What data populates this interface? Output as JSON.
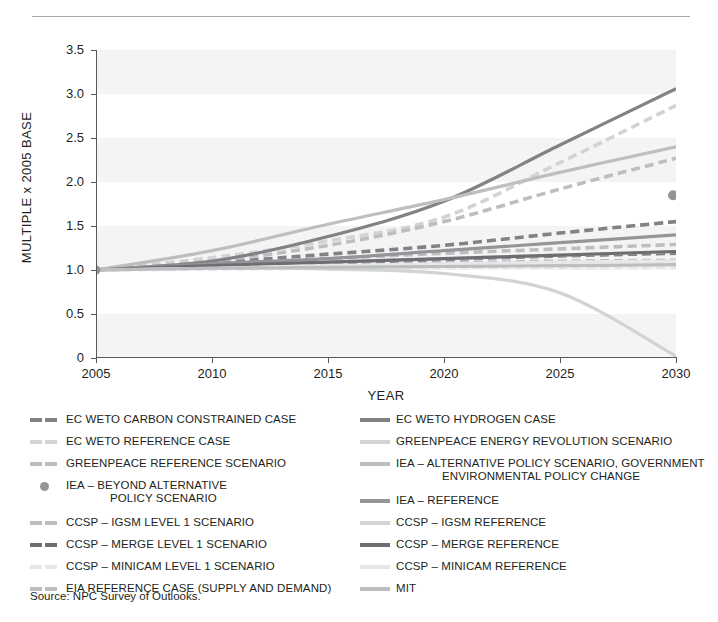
{
  "source_note": "Source: NPC Survey of Outlooks.",
  "chart_data": {
    "type": "line",
    "title": "",
    "xlabel": "YEAR",
    "ylabel": "MULTIPLE x 2005 BASE",
    "xlim": [
      2005,
      2030
    ],
    "ylim": [
      0,
      3.5
    ],
    "xticks": [
      "2005",
      "2010",
      "2015",
      "2020",
      "2025",
      "2030"
    ],
    "yticks": [
      "0",
      "0.5",
      "1.0",
      "1.5",
      "2.0",
      "2.5",
      "3.0",
      "3.5"
    ],
    "grid": "horizontal-bands",
    "legend_position": "below",
    "x": [
      2005,
      2010,
      2015,
      2020,
      2025,
      2030
    ],
    "series": [
      {
        "name": "EC WETO CARBON CONSTRAINED CASE",
        "style": "dashed",
        "color": "#808285",
        "values": [
          1.0,
          1.08,
          1.18,
          1.28,
          1.42,
          1.55
        ]
      },
      {
        "name": "EC WETO REFERENCE CASE",
        "style": "dashed",
        "color": "#d1d3d4",
        "values": [
          1.0,
          1.14,
          1.33,
          1.6,
          2.22,
          2.87
        ]
      },
      {
        "name": "GREENPEACE REFERENCE SCENARIO",
        "style": "dashed",
        "color": "#bcbec0",
        "values": [
          1.0,
          1.1,
          1.28,
          1.55,
          1.92,
          2.27
        ]
      },
      {
        "name": "IEA – BEYOND ALTERNATIVE POLICY SCENARIO",
        "style": "marker",
        "color": "#939598",
        "values": [
          null,
          null,
          null,
          null,
          null,
          1.85
        ]
      },
      {
        "name": "CCSP – IGSM LEVEL 1 SCENARIO",
        "style": "dashed",
        "color": "#bcbec0",
        "values": [
          1.0,
          1.03,
          1.06,
          1.08,
          1.1,
          1.11
        ]
      },
      {
        "name": "CCSP – MERGE LEVEL 1 SCENARIO",
        "style": "dashed",
        "color": "#808285",
        "values": [
          1.0,
          1.04,
          1.08,
          1.12,
          1.16,
          1.19
        ]
      },
      {
        "name": "CCSP – MINICAM LEVEL 1 SCENARIO",
        "style": "dashed",
        "color": "#e6e7e8",
        "values": [
          1.0,
          1.01,
          1.02,
          1.03,
          1.03,
          1.03
        ]
      },
      {
        "name": "EIA REFERENCE CASE (SUPPLY AND DEMAND)",
        "style": "dashed",
        "color": "#bcbec0",
        "values": [
          1.0,
          1.06,
          1.13,
          1.19,
          1.24,
          1.29
        ]
      },
      {
        "name": "EC WETO HYDROGEN CASE",
        "style": "solid",
        "color": "#808285",
        "values": [
          1.0,
          1.1,
          1.38,
          1.78,
          2.42,
          3.06
        ]
      },
      {
        "name": "GREENPEACE ENERGY REVOLUTION SCENARIO",
        "style": "solid",
        "color": "#d1d3d4",
        "values": [
          1.0,
          1.02,
          1.01,
          0.96,
          0.74,
          0.02
        ]
      },
      {
        "name": "IEA – ALTERNATIVE POLICY SCENARIO, GOVERNMENT ENVIRONMENTAL POLICY CHANGE",
        "style": "solid",
        "color": "#bcbec0",
        "values": [
          1.0,
          1.22,
          1.52,
          1.8,
          2.11,
          2.4
        ]
      },
      {
        "name": "IEA – REFERENCE",
        "style": "solid",
        "color": "#939598",
        "values": [
          1.0,
          1.07,
          1.13,
          1.22,
          1.31,
          1.4
        ]
      },
      {
        "name": "CCSP – IGSM REFERENCE",
        "style": "solid",
        "color": "#d1d3d4",
        "values": [
          1.0,
          1.04,
          1.09,
          1.13,
          1.17,
          1.21
        ]
      },
      {
        "name": "CCSP – MERGE REFERENCE",
        "style": "solid",
        "color": "#6d6e71",
        "values": [
          1.0,
          1.05,
          1.09,
          1.13,
          1.17,
          1.21
        ]
      },
      {
        "name": "CCSP – MINICAM REFERENCE",
        "style": "solid",
        "color": "#e6e7e8",
        "values": [
          1.0,
          1.02,
          1.05,
          1.07,
          1.09,
          1.1
        ]
      },
      {
        "name": "MIT",
        "style": "solid",
        "color": "#bcbec0",
        "values": [
          1.0,
          1.02,
          1.03,
          1.04,
          1.05,
          1.06
        ]
      }
    ]
  },
  "legend": {
    "left": [
      {
        "label": "EC WETO CARBON CONSTRAINED CASE",
        "label2": "",
        "style": "dashed",
        "color": "#808285"
      },
      {
        "label": "EC WETO REFERENCE CASE",
        "label2": "",
        "style": "dashed",
        "color": "#d1d3d4"
      },
      {
        "label": "GREENPEACE REFERENCE SCENARIO",
        "label2": "",
        "style": "dashed",
        "color": "#bcbec0"
      },
      {
        "label": "IEA – BEYOND ALTERNATIVE",
        "label2": "POLICY SCENARIO",
        "style": "marker",
        "color": "#939598"
      },
      {
        "label": "CCSP – IGSM LEVEL 1 SCENARIO",
        "label2": "",
        "style": "dashed",
        "color": "#bcbec0"
      },
      {
        "label": "CCSP – MERGE LEVEL 1 SCENARIO",
        "label2": "",
        "style": "dashed",
        "color": "#6d6e71"
      },
      {
        "label": "CCSP – MINICAM LEVEL 1 SCENARIO",
        "label2": "",
        "style": "dashed",
        "color": "#e6e7e8"
      },
      {
        "label": "EIA REFERENCE CASE (SUPPLY AND DEMAND)",
        "label2": "",
        "style": "dashed",
        "color": "#bcbec0"
      }
    ],
    "right": [
      {
        "label": "EC WETO HYDROGEN CASE",
        "label2": "",
        "style": "solid",
        "color": "#808285"
      },
      {
        "label": "GREENPEACE ENERGY REVOLUTION SCENARIO",
        "label2": "",
        "style": "solid",
        "color": "#d1d3d4"
      },
      {
        "label": "IEA – ALTERNATIVE POLICY SCENARIO, GOVERNMENT",
        "label2": "ENVIRONMENTAL POLICY CHANGE",
        "style": "solid",
        "color": "#bcbec0"
      },
      {
        "label": "IEA – REFERENCE",
        "label2": "",
        "style": "solid",
        "color": "#939598"
      },
      {
        "label": "CCSP – IGSM REFERENCE",
        "label2": "",
        "style": "solid",
        "color": "#d1d3d4"
      },
      {
        "label": "CCSP – MERGE REFERENCE",
        "label2": "",
        "style": "solid",
        "color": "#6d6e71"
      },
      {
        "label": "CCSP – MINICAM REFERENCE",
        "label2": "",
        "style": "solid",
        "color": "#e6e7e8"
      },
      {
        "label": "MIT",
        "label2": "",
        "style": "solid",
        "color": "#bcbec0"
      }
    ]
  }
}
